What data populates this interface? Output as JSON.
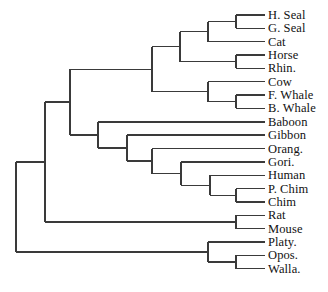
{
  "figure": {
    "type": "phylogenetic-tree",
    "style": "rectangular-cladogram",
    "width": 328,
    "height": 292,
    "background_color": "#ffffff",
    "line_color": "#3a3a3a",
    "text_color": "#111111",
    "label_font_size_px": 12.5
  },
  "taxa": [
    {
      "id": "h-seal",
      "label": "H. Seal",
      "row": 0
    },
    {
      "id": "g-seal",
      "label": "G. Seal",
      "row": 1
    },
    {
      "id": "cat",
      "label": "Cat",
      "row": 2
    },
    {
      "id": "horse",
      "label": "Horse",
      "row": 3
    },
    {
      "id": "rhin",
      "label": "Rhin.",
      "row": 4
    },
    {
      "id": "cow",
      "label": "Cow",
      "row": 5
    },
    {
      "id": "f-whale",
      "label": "F. Whale",
      "row": 6
    },
    {
      "id": "b-whale",
      "label": "B. Whale",
      "row": 7
    },
    {
      "id": "baboon",
      "label": "Baboon",
      "row": 8
    },
    {
      "id": "gibbon",
      "label": "Gibbon",
      "row": 9
    },
    {
      "id": "orang",
      "label": "Orang.",
      "row": 10
    },
    {
      "id": "gori",
      "label": "Gori.",
      "row": 11
    },
    {
      "id": "human",
      "label": "Human",
      "row": 12
    },
    {
      "id": "p-chim",
      "label": "P. Chim",
      "row": 13
    },
    {
      "id": "chim",
      "label": "Chim",
      "row": 14
    },
    {
      "id": "rat",
      "label": "Rat",
      "row": 15
    },
    {
      "id": "mouse",
      "label": "Mouse",
      "row": 16
    },
    {
      "id": "platy",
      "label": "Platy.",
      "row": 17
    },
    {
      "id": "opos",
      "label": "Opos.",
      "row": 18
    },
    {
      "id": "walla",
      "label": "Walla.",
      "row": 19
    }
  ],
  "geometry": {
    "first_row_y": 15,
    "row_spacing": 13.35,
    "leaf_tip_x": 265,
    "label_x": 268,
    "root_x": 16,
    "node_x": {
      "root": 16,
      "eutheria": 45,
      "boreo": 70,
      "ferungulata": 152,
      "laurasiatheria": 180,
      "carnivora_perisso": 208,
      "seals": 236,
      "horse_rhino": 236,
      "cetartiodactyla": 208,
      "whales": 236,
      "primates": 98,
      "hominoidea": 127,
      "greatapes": 152,
      "hominidae": 181,
      "homininae": 210,
      "pan": 236,
      "rodentia": 236,
      "marsupialia": 208,
      "diprotodontia": 236
    }
  },
  "tree": {
    "id": "root",
    "x": 16,
    "children": [
      {
        "id": "eutheria",
        "x": 45,
        "children": [
          {
            "id": "boreo",
            "x": 70,
            "children": [
              {
                "id": "ferungulata",
                "x": 152,
                "children": [
                  {
                    "id": "laurasiatheria",
                    "x": 180,
                    "children": [
                      {
                        "id": "carnivora_perisso",
                        "x": 208,
                        "children": [
                          {
                            "id": "seals",
                            "x": 236,
                            "children": [
                              {
                                "id": "h-seal",
                                "leaf": true
                              },
                              {
                                "id": "g-seal",
                                "leaf": true
                              }
                            ]
                          },
                          {
                            "id": "cat",
                            "leaf": true
                          }
                        ]
                      },
                      {
                        "id": "horse_rhino",
                        "x": 236,
                        "children": [
                          {
                            "id": "horse",
                            "leaf": true
                          },
                          {
                            "id": "rhin",
                            "leaf": true
                          }
                        ]
                      }
                    ]
                  },
                  {
                    "id": "cetartiodactyla",
                    "x": 208,
                    "children": [
                      {
                        "id": "cow",
                        "leaf": true
                      },
                      {
                        "id": "whales",
                        "x": 236,
                        "children": [
                          {
                            "id": "f-whale",
                            "leaf": true
                          },
                          {
                            "id": "b-whale",
                            "leaf": true
                          }
                        ]
                      }
                    ]
                  }
                ]
              },
              {
                "id": "primates",
                "x": 98,
                "children": [
                  {
                    "id": "baboon",
                    "leaf": true
                  },
                  {
                    "id": "hominoidea",
                    "x": 127,
                    "children": [
                      {
                        "id": "gibbon",
                        "leaf": true
                      },
                      {
                        "id": "greatapes",
                        "x": 152,
                        "children": [
                          {
                            "id": "orang",
                            "leaf": true
                          },
                          {
                            "id": "hominidae",
                            "x": 181,
                            "children": [
                              {
                                "id": "gori",
                                "leaf": true
                              },
                              {
                                "id": "homininae",
                                "x": 210,
                                "children": [
                                  {
                                    "id": "human",
                                    "leaf": true
                                  },
                                  {
                                    "id": "pan",
                                    "x": 236,
                                    "children": [
                                      {
                                        "id": "p-chim",
                                        "leaf": true
                                      },
                                      {
                                        "id": "chim",
                                        "leaf": true
                                      }
                                    ]
                                  }
                                ]
                              }
                            ]
                          }
                        ]
                      }
                    ]
                  }
                ]
              }
            ]
          },
          {
            "id": "rodentia",
            "x": 236,
            "children": [
              {
                "id": "rat",
                "leaf": true
              },
              {
                "id": "mouse",
                "leaf": true
              }
            ]
          }
        ]
      },
      {
        "id": "marsupialia",
        "x": 208,
        "children": [
          {
            "id": "platy",
            "leaf": true
          },
          {
            "id": "diprotodontia",
            "x": 236,
            "children": [
              {
                "id": "opos",
                "leaf": true
              },
              {
                "id": "walla",
                "leaf": true
              }
            ]
          }
        ]
      }
    ]
  }
}
